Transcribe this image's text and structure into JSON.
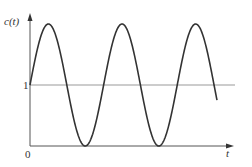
{
  "chart_data": {
    "type": "line",
    "title": "",
    "xlabel": "t",
    "ylabel": "c(t)",
    "y_ticks": [
      "0",
      "1"
    ],
    "x_ticks": [],
    "grid": false,
    "legend": null,
    "reference_lines": [
      {
        "y": 1,
        "label": "1"
      }
    ],
    "series": [
      {
        "name": "c(t)",
        "x_periods": 2.54,
        "values": [
          1,
          2,
          1,
          0,
          1,
          2,
          1,
          0,
          1,
          2,
          1
        ]
      }
    ],
    "ylim": [
      0,
      2
    ],
    "colors": {
      "curve": "#333333",
      "axes": "#555555",
      "ref_line": "#888888"
    }
  },
  "labels": {
    "y_axis": "c(t)",
    "x_axis": "t",
    "zero": "0",
    "one": "1"
  }
}
